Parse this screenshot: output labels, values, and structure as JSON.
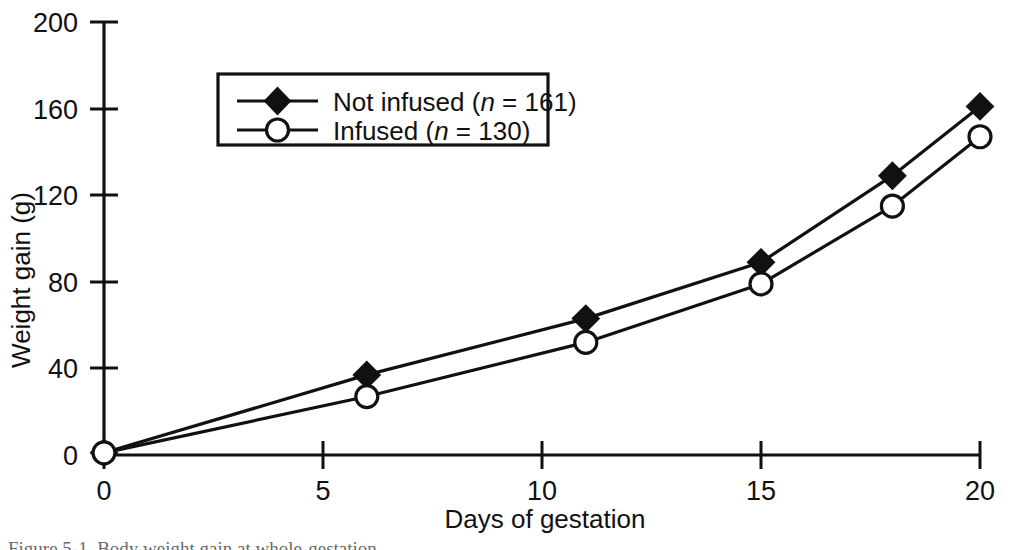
{
  "figure": {
    "caption_partial": "Figure 5-1. Body weight gain at whole-gestation",
    "background_color": "#ffffff",
    "ink_color": "#111111"
  },
  "chart_data": {
    "type": "line",
    "title": "",
    "xlabel": "Days of gestation",
    "ylabel": "Weight gain (g)",
    "xlim": [
      0,
      20
    ],
    "ylim": [
      0,
      200
    ],
    "xticks": [
      0,
      5,
      10,
      15,
      20
    ],
    "xtick_labels": [
      "0",
      "5",
      "10",
      "15",
      "20"
    ],
    "yticks": [
      0,
      40,
      80,
      120,
      160,
      200
    ],
    "ytick_labels": [
      "0",
      "40",
      "80",
      "120",
      "160",
      "200"
    ],
    "grid": false,
    "legend_position": "upper-left-center",
    "series": [
      {
        "name": "Not infused (n = 161)",
        "label_text": "Not infused (",
        "label_italic": "n",
        "label_tail": " = 161)",
        "marker": "filled-diamond",
        "color": "#111111",
        "x": [
          0,
          6,
          11,
          15,
          18,
          20
        ],
        "values": [
          1,
          37,
          63,
          89,
          129,
          161
        ]
      },
      {
        "name": "Infused (n = 130)",
        "label_text": "Infused (",
        "label_italic": "n",
        "label_tail": " = 130)",
        "marker": "open-circle",
        "color": "#111111",
        "x": [
          0,
          6,
          11,
          15,
          18,
          20
        ],
        "values": [
          1,
          27,
          52,
          79,
          115,
          147
        ]
      }
    ]
  },
  "axes": {
    "y_title": "Weight gain (g)",
    "x_title": "Days of gestation",
    "y_labels": [
      "200",
      "160",
      "120",
      "80",
      "40",
      "0"
    ],
    "x_labels": [
      "0",
      "5",
      "10",
      "15",
      "20"
    ]
  }
}
